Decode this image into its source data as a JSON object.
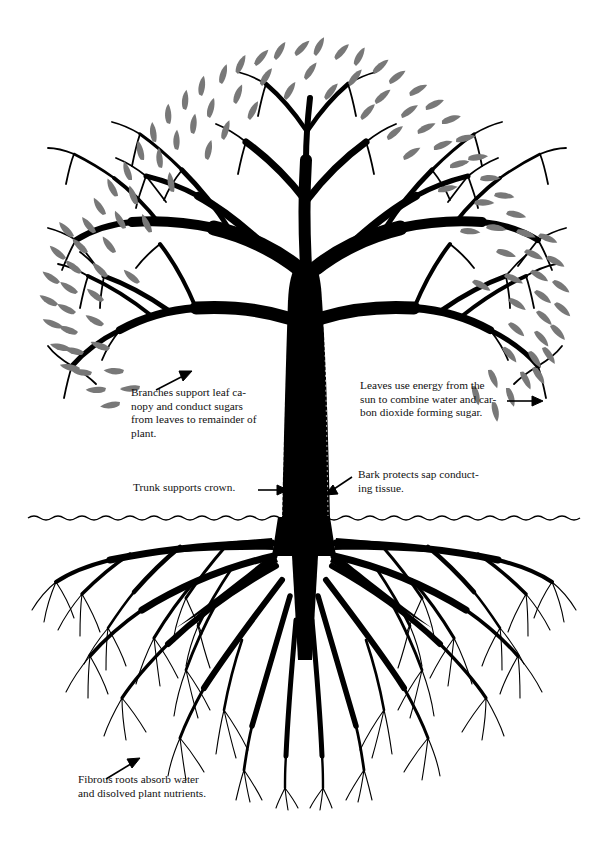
{
  "diagram": {
    "ground_line_y": 517,
    "colors": {
      "background": "#ffffff",
      "wood": "#000000",
      "leaf": "#787878",
      "leaf_dark": "#6b6b6b",
      "text": "#111111",
      "ground": "#000000"
    }
  },
  "labels": {
    "branches": {
      "name": "branches-callout",
      "lines": [
        "Branches support leaf ca-",
        "nopy and conduct sugars",
        "from leaves to remainder of",
        "plant."
      ],
      "text": "Branches support leaf canopy and conduct sugars from leaves to remainder of plant.",
      "arrow": "up-right"
    },
    "leaves": {
      "name": "leaves-callout",
      "lines": [
        "Leaves use energy from the",
        "sun to combine water and car-",
        "bon dioxide forming sugar."
      ],
      "text": "Leaves use energy from the sun to combine water and carbon dioxide forming sugar.",
      "arrow": "right"
    },
    "trunk": {
      "name": "trunk-callout",
      "lines": [
        "Trunk supports crown."
      ],
      "text": "Trunk supports crown.",
      "arrow": "right"
    },
    "bark": {
      "name": "bark-callout",
      "lines": [
        "Bark protects sap conduct-",
        "ing tissue."
      ],
      "text": "Bark protects sap conducting tissue.",
      "arrow": "down-left"
    },
    "roots": {
      "name": "roots-callout",
      "lines": [
        "Fibrous roots absorb water",
        "and disolved plant nutrients."
      ],
      "text": "Fibrous roots absorb water and disolved plant nutrients.",
      "arrow": "up-right"
    }
  },
  "parts": [
    {
      "id": "canopy",
      "label": "leaf canopy"
    },
    {
      "id": "branches",
      "label": "branches"
    },
    {
      "id": "trunk",
      "label": "trunk"
    },
    {
      "id": "bark",
      "label": "bark"
    },
    {
      "id": "ground",
      "label": "soil line"
    },
    {
      "id": "roots",
      "label": "fibrous root system"
    }
  ]
}
